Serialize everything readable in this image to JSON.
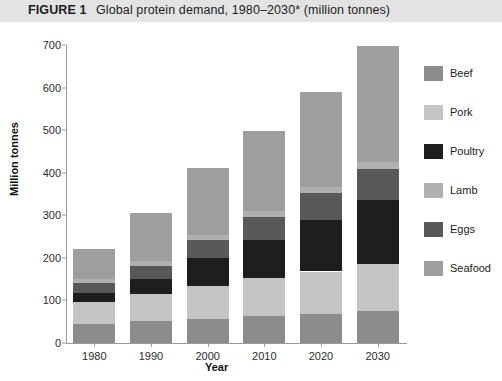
{
  "figure": {
    "number_label": "FIGURE 1",
    "title": "Global protein demand, 1980–2030* (million tonnes)"
  },
  "axes": {
    "ylabel": "Million tonnes",
    "xlabel": "Year",
    "yticks": [
      "0",
      "100",
      "200",
      "300",
      "400",
      "500",
      "600",
      "700"
    ],
    "xticks": [
      "1980",
      "1990",
      "2000",
      "2010",
      "2020",
      "2030"
    ]
  },
  "legend": {
    "items": [
      {
        "label": "Beef",
        "color": "#8c8c8c"
      },
      {
        "label": "Pork",
        "color": "#c4c4c4"
      },
      {
        "label": "Poultry",
        "color": "#1e1e1e"
      },
      {
        "label": "Lamb",
        "color": "#b0b0b0"
      },
      {
        "label": "Eggs",
        "color": "#585858"
      },
      {
        "label": "Seafood",
        "color": "#9e9e9e"
      }
    ]
  },
  "chart_data": {
    "type": "bar",
    "subtype": "stacked-vertical",
    "title": "Global protein demand, 1980–2030* (million tonnes)",
    "xlabel": "Year",
    "ylabel": "Million tonnes",
    "ylim": [
      0,
      700
    ],
    "ytick_step": 100,
    "grid": false,
    "legend_position": "right",
    "categories": [
      "1980",
      "1990",
      "2000",
      "2010",
      "2020",
      "2030"
    ],
    "stack_order_bottom_to_top": [
      "Beef",
      "Pork",
      "Poultry",
      "Eggs",
      "Lamb",
      "Seafood"
    ],
    "series": [
      {
        "name": "Beef",
        "color": "#8c8c8c",
        "values": [
          45,
          52,
          57,
          63,
          68,
          75
        ]
      },
      {
        "name": "Pork",
        "color": "#c4c4c4",
        "values": [
          52,
          63,
          77,
          90,
          100,
          110
        ]
      },
      {
        "name": "Poultry",
        "color": "#1e1e1e",
        "values": [
          20,
          35,
          65,
          90,
          122,
          150
        ]
      },
      {
        "name": "Eggs",
        "color": "#585858",
        "values": [
          25,
          32,
          43,
          52,
          62,
          73
        ]
      },
      {
        "name": "Lamb",
        "color": "#b0b0b0",
        "values": [
          8,
          10,
          12,
          14,
          15,
          17
        ]
      },
      {
        "name": "Seafood",
        "color": "#9e9e9e",
        "values": [
          72,
          113,
          158,
          188,
          223,
          273
        ]
      }
    ],
    "totals": [
      222,
      305,
      412,
      497,
      590,
      698
    ],
    "footnote_marker": "*"
  }
}
